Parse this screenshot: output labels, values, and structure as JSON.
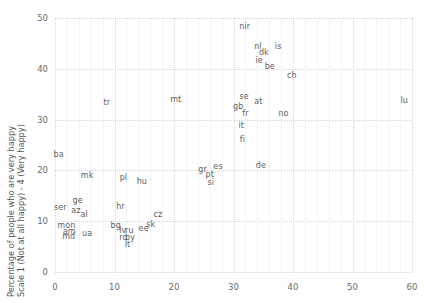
{
  "chart_data": {
    "type": "scatter",
    "title": "",
    "subtitle": "",
    "xlabel": "",
    "ylabel": "Percentage of people who are very happy Scale 1 (Not at all happy) - 4 (Very happy)",
    "ylabel_lines": [
      "Percentage of people who are very happy",
      "Scale 1 (Not at all happy) - 4 (Very happy)"
    ],
    "xlim": [
      0,
      60
    ],
    "ylim": [
      0,
      50
    ],
    "xticks": [
      0,
      10,
      20,
      30,
      40,
      50,
      60
    ],
    "yticks": [
      0,
      10,
      20,
      30,
      40,
      50
    ],
    "xtick_labels": [
      "0",
      "10",
      "20",
      "30",
      "40",
      "50",
      "60"
    ],
    "ytick_labels": [
      "0",
      "10",
      "20",
      "30",
      "40",
      "50"
    ],
    "grid": true,
    "grid_style": "dotted",
    "legend": "none",
    "marker": "text-label",
    "label_color": "#5e5e5e",
    "grid_color": "#d6d6d6",
    "points": [
      {
        "label": "nir",
        "x": 31.9,
        "y": 48.3
      },
      {
        "label": "nl",
        "x": 34.1,
        "y": 44.2
      },
      {
        "label": "dk",
        "x": 35.1,
        "y": 43.2
      },
      {
        "label": "is",
        "x": 37.5,
        "y": 44.2
      },
      {
        "label": "ie",
        "x": 34.3,
        "y": 41.6
      },
      {
        "label": "be",
        "x": 36.1,
        "y": 40.3
      },
      {
        "label": "ch",
        "x": 39.8,
        "y": 38.5
      },
      {
        "label": "se",
        "x": 31.8,
        "y": 34.4
      },
      {
        "label": "at",
        "x": 34.2,
        "y": 33.4
      },
      {
        "label": "gb",
        "x": 30.8,
        "y": 32.4
      },
      {
        "label": "fr",
        "x": 32.0,
        "y": 31.1
      },
      {
        "label": "no",
        "x": 38.4,
        "y": 31.1
      },
      {
        "label": "lu",
        "x": 58.7,
        "y": 33.6
      },
      {
        "label": "mt",
        "x": 20.3,
        "y": 33.8
      },
      {
        "label": "tr",
        "x": 8.7,
        "y": 33.3
      },
      {
        "label": "it",
        "x": 31.3,
        "y": 28.8
      },
      {
        "label": "fi",
        "x": 31.5,
        "y": 25.9
      },
      {
        "label": "ba",
        "x": 0.6,
        "y": 23.1
      },
      {
        "label": "de",
        "x": 34.6,
        "y": 20.8
      },
      {
        "label": "es",
        "x": 27.4,
        "y": 20.6
      },
      {
        "label": "gr",
        "x": 24.8,
        "y": 20.0
      },
      {
        "label": "pt",
        "x": 26.0,
        "y": 19.1
      },
      {
        "label": "si",
        "x": 26.2,
        "y": 17.5
      },
      {
        "label": "mk",
        "x": 5.4,
        "y": 18.8
      },
      {
        "label": "pl",
        "x": 11.5,
        "y": 18.5
      },
      {
        "label": "hu",
        "x": 14.6,
        "y": 17.7
      },
      {
        "label": "ge",
        "x": 3.8,
        "y": 13.9
      },
      {
        "label": "ser",
        "x": 0.9,
        "y": 12.6
      },
      {
        "label": "az",
        "x": 3.5,
        "y": 12.0
      },
      {
        "label": "al",
        "x": 4.9,
        "y": 11.2
      },
      {
        "label": "hr",
        "x": 11.0,
        "y": 12.8
      },
      {
        "label": "cz",
        "x": 17.3,
        "y": 11.2
      },
      {
        "label": "mon",
        "x": 1.9,
        "y": 9.1
      },
      {
        "label": "am",
        "x": 2.4,
        "y": 7.8
      },
      {
        "label": "md",
        "x": 2.3,
        "y": 6.9
      },
      {
        "label": "ua",
        "x": 5.4,
        "y": 7.5
      },
      {
        "label": "bg",
        "x": 10.2,
        "y": 9.0
      },
      {
        "label": "lv",
        "x": 11.4,
        "y": 8.1
      },
      {
        "label": "ru",
        "x": 12.5,
        "y": 8.1
      },
      {
        "label": "ro",
        "x": 11.5,
        "y": 6.7
      },
      {
        "label": "by",
        "x": 12.6,
        "y": 6.7
      },
      {
        "label": "lt",
        "x": 12.2,
        "y": 5.4
      },
      {
        "label": "ee",
        "x": 14.9,
        "y": 8.4
      },
      {
        "label": "sk",
        "x": 16.1,
        "y": 9.2
      }
    ]
  }
}
